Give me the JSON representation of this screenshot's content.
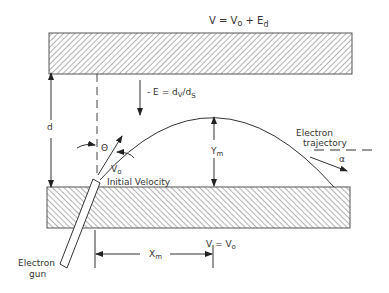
{
  "diagram": {
    "top_plate_label": {
      "main": "V = V",
      "sub": "o",
      "tail": " + E",
      "tail_sub": "d"
    },
    "bottom_plate_label": {
      "main": "V = V",
      "sub": "o"
    },
    "field_label": {
      "pre": "- E = d",
      "sub1": "V",
      "mid": "/d",
      "sub2": "S"
    },
    "separation_label": "d",
    "angle_label": "Θ",
    "velocity_label": {
      "main": "V",
      "sub": "o"
    },
    "initial_velocity_label": "Initial Velocity",
    "ym_label": {
      "main": "Y",
      "sub": "m"
    },
    "xm_label": {
      "main": "X",
      "sub": "m"
    },
    "trajectory_label_line1": "Electron",
    "trajectory_label_line2": "trajectory",
    "alpha_label": "α",
    "gun_label_line1": "Electron",
    "gun_label_line2": "gun",
    "colors": {
      "stroke": "#333333",
      "hatch": "#555555",
      "background": "#ffffff"
    }
  }
}
